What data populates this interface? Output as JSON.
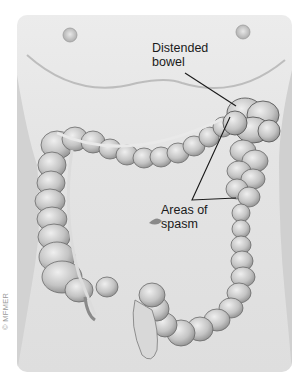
{
  "figure": {
    "labels": {
      "distended_line1": "Distended",
      "distended_line2": "bowel",
      "spasm_line1": "Areas of",
      "spasm_line2": "spasm"
    },
    "copyright": "© MFMER",
    "colors": {
      "background": "#ffffff",
      "panel": "#e6e6e6",
      "skin_shade": "#c8c8c8",
      "colon_fill": "#c9c9c9",
      "colon_outline": "#6a6a6a",
      "label_text": "#1a1a1a",
      "leader_line": "#1a1a1a"
    }
  }
}
